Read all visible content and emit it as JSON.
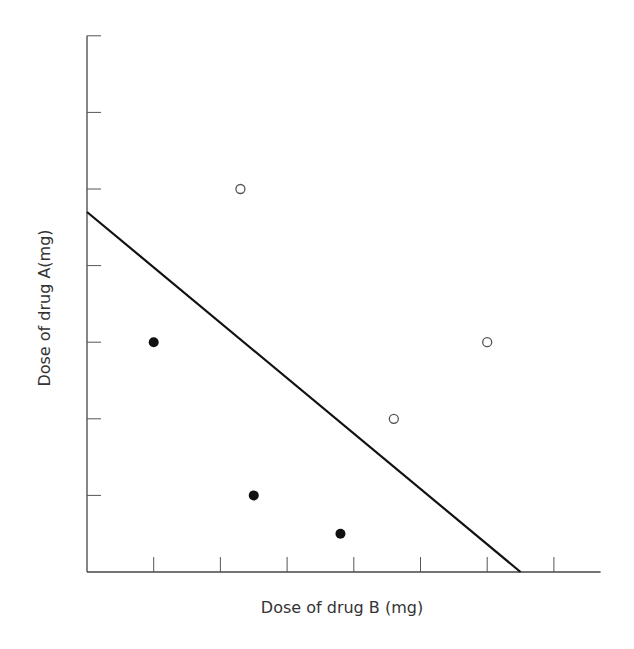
{
  "chart_data": {
    "type": "scatter",
    "title": "",
    "xlabel": "Dose of drug B (mg)",
    "ylabel": "Dose of drug A(mg)",
    "xlim": [
      0,
      7.7
    ],
    "ylim": [
      0,
      7
    ],
    "x_ticks": [
      1,
      2,
      3,
      4,
      5,
      6,
      7
    ],
    "y_ticks": [
      1,
      2,
      3,
      4,
      5,
      6,
      7
    ],
    "tick_labels_shown": false,
    "grid": false,
    "legend": null,
    "series": [
      {
        "name": "filled",
        "marker": "filled-circle",
        "color": "#111111",
        "points": [
          [
            1.0,
            3.0
          ],
          [
            2.5,
            1.0
          ],
          [
            3.8,
            0.5
          ]
        ]
      },
      {
        "name": "open",
        "marker": "open-circle",
        "color": "#555555",
        "points": [
          [
            2.3,
            5.0
          ],
          [
            4.6,
            2.0
          ],
          [
            6.0,
            3.0
          ]
        ]
      }
    ],
    "lines": [
      {
        "name": "isobole",
        "from": [
          0,
          4.7
        ],
        "to": [
          6.5,
          0
        ],
        "color": "#111111"
      }
    ]
  },
  "axes": {
    "x_label": "Dose of drug B (mg)",
    "y_label": "Dose of drug A(mg)"
  }
}
